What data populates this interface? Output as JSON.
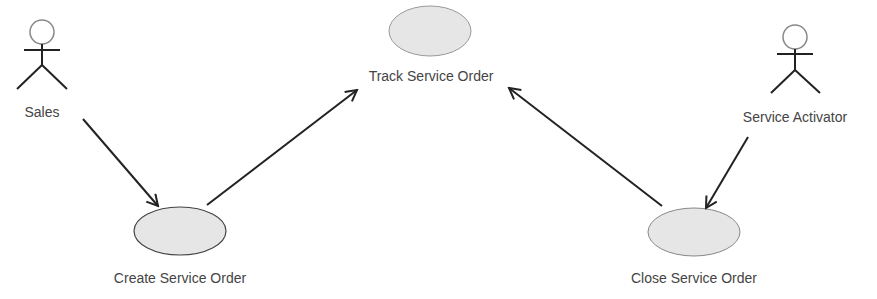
{
  "diagram": {
    "type": "use-case",
    "colors": {
      "stroke": "#222222",
      "ellipse_fill": "#e6e6e6",
      "ellipse_stroke": "#555555",
      "text": "#444444",
      "actor_head": "#888888"
    },
    "actors": [
      {
        "id": "sales",
        "label": "Sales"
      },
      {
        "id": "service-activator",
        "label": "Service Activator"
      }
    ],
    "use_cases": [
      {
        "id": "track",
        "label": "Track Service Order"
      },
      {
        "id": "create",
        "label": "Create Service Order"
      },
      {
        "id": "close",
        "label": "Close Service Order"
      }
    ],
    "relationships": [
      {
        "from": "Sales",
        "to": "Create Service Order"
      },
      {
        "from": "Create Service Order",
        "to": "Track Service Order"
      },
      {
        "from": "Close Service Order",
        "to": "Track Service Order"
      },
      {
        "from": "Service Activator",
        "to": "Close Service Order"
      }
    ]
  }
}
